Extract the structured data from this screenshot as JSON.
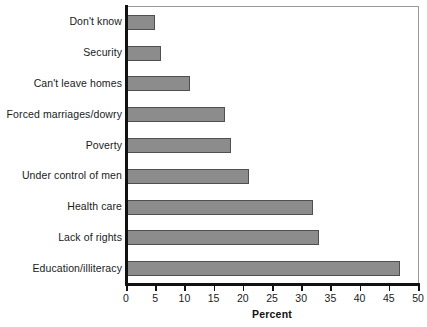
{
  "chart_data": {
    "type": "bar",
    "orientation": "horizontal",
    "title": "",
    "xlabel": "Percent",
    "ylabel": "",
    "xlim": [
      0,
      50
    ],
    "xticks": [
      0,
      5,
      10,
      15,
      20,
      25,
      30,
      35,
      40,
      45,
      50
    ],
    "grid": false,
    "legend": null,
    "categories": [
      "Don't know",
      "Security",
      "Can't leave homes",
      "Forced marriages/dowry",
      "Poverty",
      "Under control of men",
      "Health care",
      "Lack of rights",
      "Education/illiteracy"
    ],
    "values": [
      5,
      6,
      11,
      17,
      18,
      21,
      32,
      33,
      47
    ],
    "bar_color": "#8c8c8c",
    "bar_border_color": "#4f4f4f",
    "axis_color": "#111111",
    "frame_color": "#9a9a9a"
  }
}
